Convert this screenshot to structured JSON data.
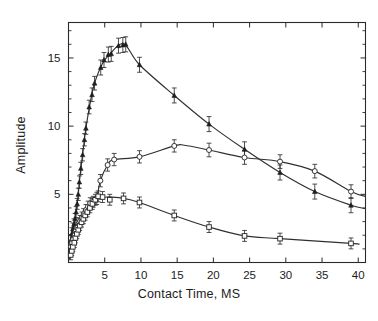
{
  "chart_data": {
    "type": "line",
    "title": "",
    "xlabel": "Contact Time, MS",
    "ylabel": "Amplitude",
    "xlim": [
      0,
      41
    ],
    "ylim": [
      0,
      17.6
    ],
    "xticks": [
      5,
      10,
      15,
      20,
      25,
      30,
      35,
      40
    ],
    "xtick_labels": [
      "5",
      "10",
      "15",
      "20",
      "25",
      "30",
      "35",
      "40"
    ],
    "yticks": [
      5,
      10,
      15
    ],
    "ytick_labels": [
      "5",
      "10",
      "15"
    ],
    "y_minor_ticks": [
      1,
      2,
      3,
      4,
      6,
      7,
      8,
      9,
      11,
      12,
      13,
      14,
      16,
      17
    ],
    "grid": false,
    "legend": "none",
    "frame": "box-all-sides-ticks-inward",
    "series": [
      {
        "name": "upper-curve",
        "marker": "triangle-filled",
        "error_bars": true,
        "points": [
          {
            "x": 0.3,
            "y": 1.6,
            "err": 0.45
          },
          {
            "x": 0.45,
            "y": 2.1,
            "err": 0.45
          },
          {
            "x": 0.6,
            "y": 2.45,
            "err": 0.45
          },
          {
            "x": 0.75,
            "y": 2.8,
            "err": 0.4
          },
          {
            "x": 0.9,
            "y": 3.2,
            "err": 0.4
          },
          {
            "x": 1.05,
            "y": 3.7,
            "err": 0.4
          },
          {
            "x": 1.2,
            "y": 4.3,
            "err": 0.4
          },
          {
            "x": 1.35,
            "y": 5.0,
            "err": 0.45
          },
          {
            "x": 1.5,
            "y": 5.9,
            "err": 0.45
          },
          {
            "x": 1.7,
            "y": 6.9,
            "err": 0.45
          },
          {
            "x": 1.95,
            "y": 7.9,
            "err": 0.45
          },
          {
            "x": 2.2,
            "y": 9.0,
            "err": 0.45
          },
          {
            "x": 2.4,
            "y": 9.85,
            "err": 0.45
          },
          {
            "x": 2.85,
            "y": 11.4,
            "err": 0.5
          },
          {
            "x": 3.25,
            "y": 12.3,
            "err": 0.5
          },
          {
            "x": 3.6,
            "y": 13.15,
            "err": 0.5
          },
          {
            "x": 4.45,
            "y": 14.3,
            "err": 0.55
          },
          {
            "x": 4.9,
            "y": 14.85,
            "err": 0.55
          },
          {
            "x": 5.5,
            "y": 15.25,
            "err": 0.55
          },
          {
            "x": 5.9,
            "y": 15.3,
            "err": 0.55
          },
          {
            "x": 6.9,
            "y": 15.9,
            "err": 0.55
          },
          {
            "x": 7.5,
            "y": 15.95,
            "err": 0.55
          },
          {
            "x": 7.9,
            "y": 16.0,
            "err": 0.55
          },
          {
            "x": 9.8,
            "y": 14.5,
            "err": 0.55
          },
          {
            "x": 14.6,
            "y": 12.25,
            "err": 0.55
          },
          {
            "x": 19.4,
            "y": 10.15,
            "err": 0.55
          },
          {
            "x": 24.3,
            "y": 8.3,
            "err": 0.55
          },
          {
            "x": 29.2,
            "y": 6.6,
            "err": 0.55
          },
          {
            "x": 34.0,
            "y": 5.2,
            "err": 0.55
          },
          {
            "x": 39.0,
            "y": 4.2,
            "err": 0.55
          }
        ],
        "fit": {
          "peak_x": 7.6,
          "peak_y": 16.05,
          "end_x": 41.0,
          "end_y": 3.95
        }
      },
      {
        "name": "middle-curve",
        "marker": "circle-open",
        "error_bars": true,
        "points": [
          {
            "x": 0.35,
            "y": 1.15,
            "err": 0.4
          },
          {
            "x": 0.5,
            "y": 1.45,
            "err": 0.4
          },
          {
            "x": 0.65,
            "y": 1.7,
            "err": 0.4
          },
          {
            "x": 0.85,
            "y": 2.0,
            "err": 0.4
          },
          {
            "x": 1.0,
            "y": 2.3,
            "err": 0.4
          },
          {
            "x": 1.2,
            "y": 2.55,
            "err": 0.4
          },
          {
            "x": 1.4,
            "y": 2.85,
            "err": 0.4
          },
          {
            "x": 1.6,
            "y": 3.05,
            "err": 0.4
          },
          {
            "x": 1.85,
            "y": 3.3,
            "err": 0.4
          },
          {
            "x": 2.1,
            "y": 3.55,
            "err": 0.4
          },
          {
            "x": 2.4,
            "y": 3.85,
            "err": 0.4
          },
          {
            "x": 2.7,
            "y": 4.1,
            "err": 0.4
          },
          {
            "x": 3.0,
            "y": 4.35,
            "err": 0.4
          },
          {
            "x": 3.4,
            "y": 4.45,
            "err": 0.4
          },
          {
            "x": 3.9,
            "y": 4.7,
            "err": 0.45
          },
          {
            "x": 4.4,
            "y": 6.0,
            "err": 0.45
          },
          {
            "x": 5.4,
            "y": 7.15,
            "err": 0.45
          },
          {
            "x": 6.3,
            "y": 7.55,
            "err": 0.45
          },
          {
            "x": 9.8,
            "y": 7.75,
            "err": 0.45
          },
          {
            "x": 14.6,
            "y": 8.55,
            "err": 0.45
          },
          {
            "x": 19.4,
            "y": 8.25,
            "err": 0.5
          },
          {
            "x": 24.3,
            "y": 7.7,
            "err": 0.5
          },
          {
            "x": 29.2,
            "y": 7.4,
            "err": 0.5
          },
          {
            "x": 34.0,
            "y": 6.7,
            "err": 0.5
          },
          {
            "x": 39.0,
            "y": 5.2,
            "err": 0.5
          }
        ],
        "fit": {
          "peak_x": 16.0,
          "peak_y": 8.6,
          "end_x": 41.0,
          "end_y": 4.85
        }
      },
      {
        "name": "lower-curve",
        "marker": "square-open",
        "error_bars": true,
        "points": [
          {
            "x": 0.3,
            "y": 0.55,
            "err": 0.35
          },
          {
            "x": 0.45,
            "y": 0.85,
            "err": 0.35
          },
          {
            "x": 0.6,
            "y": 1.15,
            "err": 0.35
          },
          {
            "x": 0.8,
            "y": 1.45,
            "err": 0.35
          },
          {
            "x": 0.95,
            "y": 1.8,
            "err": 0.35
          },
          {
            "x": 1.15,
            "y": 2.1,
            "err": 0.35
          },
          {
            "x": 1.35,
            "y": 2.4,
            "err": 0.35
          },
          {
            "x": 1.55,
            "y": 2.7,
            "err": 0.35
          },
          {
            "x": 1.8,
            "y": 2.95,
            "err": 0.35
          },
          {
            "x": 2.05,
            "y": 3.2,
            "err": 0.35
          },
          {
            "x": 2.3,
            "y": 3.45,
            "err": 0.35
          },
          {
            "x": 2.6,
            "y": 3.7,
            "err": 0.35
          },
          {
            "x": 2.95,
            "y": 4.0,
            "err": 0.35
          },
          {
            "x": 3.3,
            "y": 4.3,
            "err": 0.4
          },
          {
            "x": 3.7,
            "y": 4.6,
            "err": 0.4
          },
          {
            "x": 4.1,
            "y": 4.85,
            "err": 0.4
          },
          {
            "x": 4.7,
            "y": 4.8,
            "err": 0.4
          },
          {
            "x": 5.7,
            "y": 4.6,
            "err": 0.4
          },
          {
            "x": 7.6,
            "y": 4.7,
            "err": 0.4
          },
          {
            "x": 9.8,
            "y": 4.4,
            "err": 0.4
          },
          {
            "x": 14.6,
            "y": 3.45,
            "err": 0.4
          },
          {
            "x": 19.4,
            "y": 2.6,
            "err": 0.4
          },
          {
            "x": 24.3,
            "y": 1.95,
            "err": 0.4
          },
          {
            "x": 29.2,
            "y": 1.75,
            "err": 0.4
          },
          {
            "x": 39.0,
            "y": 1.4,
            "err": 0.4
          }
        ],
        "fit": {
          "peak_x": 5.2,
          "peak_y": 4.8,
          "end_x": 40.0,
          "end_y": 1.35
        }
      }
    ]
  }
}
